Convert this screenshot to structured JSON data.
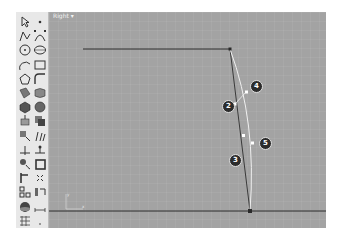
{
  "viewport": {
    "title": "Right",
    "menu_arrow": "▾",
    "background": "#a3a3a3",
    "axis_labels": {
      "y": "y",
      "x": "x"
    }
  },
  "toolbar": {
    "tools": [
      {
        "name": "select-pointer-icon"
      },
      {
        "name": "point-icon"
      },
      {
        "name": "polyline-icon"
      },
      {
        "name": "curve-control-points-icon"
      },
      {
        "name": "circle-icon"
      },
      {
        "name": "ellipse-icon"
      },
      {
        "name": "arc-icon"
      },
      {
        "name": "rectangle-icon"
      },
      {
        "name": "polygon-icon"
      },
      {
        "name": "fillet-curve-icon"
      },
      {
        "name": "surface-corner-icon"
      },
      {
        "name": "surface-loft-icon"
      },
      {
        "name": "solid-box-icon"
      },
      {
        "name": "solid-sphere-icon"
      },
      {
        "name": "extrude-icon"
      },
      {
        "name": "boolean-icon"
      },
      {
        "name": "transform-icon"
      },
      {
        "name": "analyze-icon"
      },
      {
        "name": "trim-icon"
      },
      {
        "name": "split-icon"
      },
      {
        "name": "blend-curve-icon"
      },
      {
        "name": "offset-icon"
      },
      {
        "name": "join-icon"
      },
      {
        "name": "explode-icon"
      },
      {
        "name": "group-icon"
      },
      {
        "name": "array-icon"
      },
      {
        "name": "render-icon"
      },
      {
        "name": "dimension-icon"
      },
      {
        "name": "grid-icon"
      },
      {
        "name": "more-icon"
      }
    ]
  },
  "callouts": [
    {
      "label": "2"
    },
    {
      "label": "4"
    },
    {
      "label": "5"
    },
    {
      "label": "3"
    }
  ]
}
